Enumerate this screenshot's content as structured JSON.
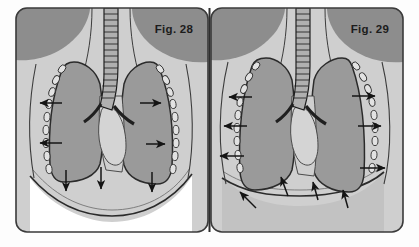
{
  "plate": {
    "width": 419,
    "height": 247,
    "outer_background": "#fdfdfd",
    "panel_border_color": "#3a3a3a",
    "divider_color": "#2e2e2e"
  },
  "palette": {
    "paper": "#fdfdfd",
    "soft_tissue_light": "#cfcfcf",
    "soft_tissue_mid": "#bdbdbd",
    "muscle_dark": "#8d8d8d",
    "lung_gray": "#9a9a9a",
    "lung_outline": "#2b2b2b",
    "abdomen_white": "#ffffff",
    "abdomen_gray": "#c2c2c2",
    "rib_fill": "#e2e2e2",
    "rib_outline": "#303030",
    "arrow_color": "#141414",
    "trachea_fill": "#b0b0b0",
    "trachea_ring": "#1f1f1f",
    "heart_fill": "#d4d4d4",
    "line_color": "#3c3c3c"
  },
  "panels": [
    {
      "id": "panel-left",
      "label": "Fig. 28",
      "label_x": 174,
      "label_y": 33,
      "phase": "expiration",
      "abdomen_fill": "#ffffff",
      "diaphragm_shape": "domed-high",
      "arrow_direction": "inward-downward",
      "arrows": [
        {
          "name": "chest-wall-arrow-left-upper",
          "x1": 60,
          "y1": 103,
          "x2": 38,
          "y2": 103,
          "dir": "left"
        },
        {
          "name": "chest-wall-arrow-left-lower",
          "x1": 60,
          "y1": 143,
          "x2": 38,
          "y2": 143,
          "dir": "left"
        },
        {
          "name": "chest-wall-arrow-right-upper",
          "x1": 140,
          "y1": 103,
          "x2": 162,
          "y2": 103,
          "dir": "right"
        },
        {
          "name": "chest-wall-arrow-right-lower",
          "x1": 146,
          "y1": 144,
          "x2": 166,
          "y2": 144,
          "dir": "right"
        },
        {
          "name": "diaphragm-arrow-left",
          "x1": 66,
          "y1": 170,
          "x2": 66,
          "y2": 192,
          "dir": "down"
        },
        {
          "name": "diaphragm-arrow-center",
          "x1": 101,
          "y1": 168,
          "x2": 101,
          "y2": 190,
          "dir": "down"
        },
        {
          "name": "diaphragm-arrow-right",
          "x1": 152,
          "y1": 172,
          "x2": 152,
          "y2": 193,
          "dir": "down"
        }
      ]
    },
    {
      "id": "panel-right",
      "label": "Fig. 29",
      "label_x": 382,
      "label_y": 33,
      "phase": "inspiration",
      "abdomen_fill": "#c2c2c2",
      "diaphragm_shape": "flattened-low",
      "arrow_direction": "outward-upward",
      "arrows": [
        {
          "name": "chest-wall-arrow-left-upper",
          "x1": 252,
          "y1": 97,
          "x2": 228,
          "y2": 97,
          "dir": "left"
        },
        {
          "name": "chest-wall-arrow-left-mid",
          "x1": 246,
          "y1": 126,
          "x2": 222,
          "y2": 126,
          "dir": "left"
        },
        {
          "name": "chest-wall-arrow-left-lower",
          "x1": 243,
          "y1": 156,
          "x2": 218,
          "y2": 156,
          "dir": "left"
        },
        {
          "name": "chest-wall-arrow-right-upper",
          "x1": 352,
          "y1": 96,
          "x2": 376,
          "y2": 96,
          "dir": "right"
        },
        {
          "name": "chest-wall-arrow-right-mid",
          "x1": 358,
          "y1": 126,
          "x2": 382,
          "y2": 126,
          "dir": "right"
        },
        {
          "name": "chest-wall-arrow-right-lower",
          "x1": 360,
          "y1": 168,
          "x2": 386,
          "y2": 168,
          "dir": "right"
        },
        {
          "name": "diaphragm-arrow-far-left",
          "x1": 255,
          "y1": 208,
          "x2": 238,
          "y2": 191,
          "dir": "up-left"
        },
        {
          "name": "diaphragm-arrow-left",
          "x1": 288,
          "y1": 196,
          "x2": 280,
          "y2": 175,
          "dir": "up"
        },
        {
          "name": "diaphragm-arrow-center",
          "x1": 318,
          "y1": 200,
          "x2": 312,
          "y2": 180,
          "dir": "up"
        },
        {
          "name": "diaphragm-arrow-right",
          "x1": 348,
          "y1": 208,
          "x2": 342,
          "y2": 188,
          "dir": "up"
        }
      ]
    }
  ],
  "anatomy": {
    "structures": [
      {
        "name": "trachea",
        "description": "midline airway with cartilage rings"
      },
      {
        "name": "main-bronchi",
        "description": "bifurcation at carina"
      },
      {
        "name": "lung-left",
        "description": "shaded lung field"
      },
      {
        "name": "lung-right",
        "description": "shaded lung field"
      },
      {
        "name": "ribs",
        "description": "chain of oval rib cross-sections along chest wall"
      },
      {
        "name": "diaphragm",
        "description": "muscular dome separating thorax and abdomen"
      },
      {
        "name": "heart",
        "description": "mediastinal cardiac silhouette"
      },
      {
        "name": "shoulder-muscle",
        "description": "dark soft tissue mass at apex"
      },
      {
        "name": "abdomen",
        "description": "region below diaphragm"
      }
    ],
    "rib_count_per_side": 9
  }
}
